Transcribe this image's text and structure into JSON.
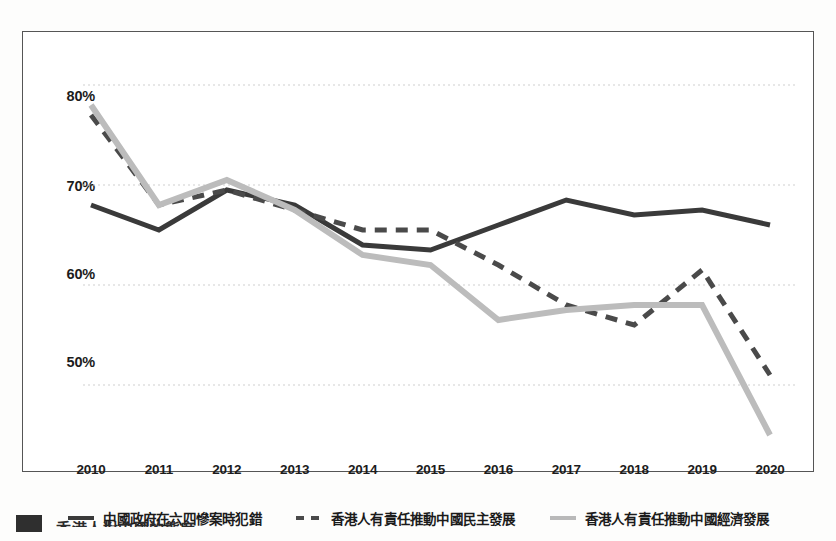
{
  "chart_data": {
    "type": "line",
    "title": "",
    "xlabel": "",
    "ylabel": "",
    "x": [
      2010,
      2011,
      2012,
      2013,
      2014,
      2015,
      2016,
      2017,
      2018,
      2019,
      2020
    ],
    "categories": [
      "2010",
      "2011",
      "2012",
      "2013",
      "2014",
      "2015",
      "2016",
      "2017",
      "2018",
      "2019",
      "2020"
    ],
    "ylim": [
      42,
      82
    ],
    "yticks": [
      50,
      60,
      70,
      80
    ],
    "ytick_labels": [
      "50%",
      "60%",
      "70%",
      "80%"
    ],
    "grid": "horizontal-dotted",
    "legend_position": "bottom-center",
    "series": [
      {
        "name": "中國政府在六四慘案時犯錯",
        "style": "solid",
        "color": "#3a3a3a",
        "values": [
          68.0,
          65.5,
          69.5,
          68.0,
          64.0,
          63.5,
          66.0,
          68.5,
          67.0,
          67.5,
          66.0
        ]
      },
      {
        "name": "香港人有責任推動中國民主發展",
        "style": "dashed",
        "color": "#4a4a4a",
        "values": [
          77.0,
          68.0,
          69.5,
          67.5,
          65.5,
          65.5,
          62.0,
          58.0,
          56.0,
          61.5,
          51.0
        ]
      },
      {
        "name": "香港人有責任推動中國經濟發展",
        "style": "solid",
        "color": "#bcbcbc",
        "values": [
          78.0,
          68.0,
          70.5,
          67.5,
          63.0,
          62.0,
          56.5,
          57.5,
          58.0,
          58.0,
          45.0
        ]
      }
    ]
  },
  "axis": {
    "y_ticks": [
      "80%",
      "70%",
      "60%",
      "50%"
    ],
    "x_ticks": [
      "2010",
      "2011",
      "2012",
      "2013",
      "2014",
      "2015",
      "2016",
      "2017",
      "2018",
      "2019",
      "2020"
    ]
  },
  "legend": {
    "items": [
      {
        "label": "中國政府在六四慘案時犯錯",
        "marker": "solid-dark-line-icon"
      },
      {
        "label": "香港人有責任推動中國民主發展",
        "marker": "dashed-dark-line-icon"
      },
      {
        "label": "香港人有責任推動中國經濟發展",
        "marker": "solid-light-line-icon"
      }
    ]
  },
  "caption": {
    "text": "香港人對中國的態度"
  },
  "colors": {
    "series_dark": "#3a3a3a",
    "series_dashed": "#4a4a4a",
    "series_light": "#bcbcbc",
    "frame": "#555555",
    "grid": "#cfcfcf",
    "text": "#1b1b1b"
  }
}
